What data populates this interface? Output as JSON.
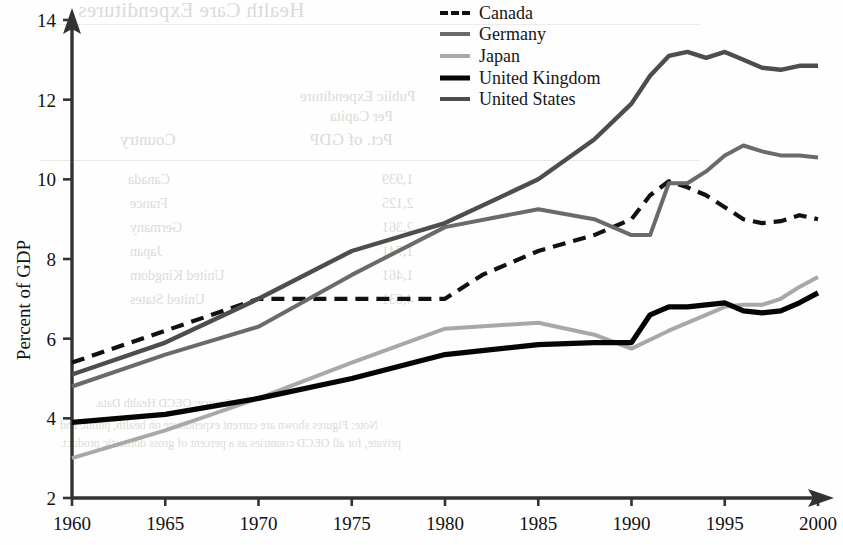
{
  "figure": {
    "y_axis_title": "Percent of GDP",
    "background_bleed": {
      "title": "Health Care Expenditures",
      "head_1": "Public Expenditure",
      "head_2": "Per Capita",
      "head_3": "Country",
      "head_4": "Pct. of GDP",
      "col_left": [
        "Canada",
        "France",
        "Germany",
        "Japan",
        "United Kingdom",
        "United States"
      ],
      "col_right": [
        "1,939",
        "2,125",
        "2,361",
        "1,741",
        "1,461",
        "4,631"
      ],
      "foot_1": "Source: OECD Health Data.",
      "foot_2": "Note: Figures shown are current expenditure on health, public and",
      "foot_3": "private, for all OECD countries as a percent of gross domestic product."
    }
  },
  "chart_data": {
    "type": "line",
    "title": "",
    "xlabel": "",
    "ylabel": "Percent of GDP",
    "xlim": [
      1960,
      2000
    ],
    "ylim": [
      2,
      14
    ],
    "xticks": [
      1960,
      1965,
      1970,
      1975,
      1980,
      1985,
      1990,
      1995,
      2000
    ],
    "yticks": [
      2,
      4,
      6,
      8,
      10,
      12,
      14
    ],
    "grid": false,
    "legend_position": "top-right",
    "series": [
      {
        "name": "Canada",
        "color": "#111111",
        "width": 4.2,
        "dash": "13,8",
        "x": [
          1960,
          1965,
          1970,
          1971,
          1975,
          1980,
          1982,
          1985,
          1988,
          1990,
          1991,
          1992,
          1993,
          1994,
          1995,
          1996,
          1997,
          1998,
          1999,
          2000
        ],
        "values": [
          5.4,
          6.2,
          7.0,
          7.0,
          7.0,
          7.0,
          7.6,
          8.2,
          8.6,
          9.0,
          9.6,
          9.95,
          9.8,
          9.6,
          9.3,
          9.0,
          8.9,
          8.95,
          9.1,
          9.0
        ]
      },
      {
        "name": "Germany",
        "color": "#6a6a6a",
        "width": 4.0,
        "dash": "",
        "x": [
          1960,
          1965,
          1970,
          1975,
          1980,
          1985,
          1988,
          1990,
          1991,
          1992,
          1993,
          1994,
          1995,
          1996,
          1997,
          1998,
          1999,
          2000
        ],
        "values": [
          4.8,
          5.6,
          6.3,
          7.6,
          8.8,
          9.25,
          9.0,
          8.6,
          8.6,
          9.9,
          9.9,
          10.2,
          10.6,
          10.85,
          10.7,
          10.6,
          10.6,
          10.55
        ]
      },
      {
        "name": "Japan",
        "color": "#a8a8a8",
        "width": 4.0,
        "dash": "",
        "x": [
          1960,
          1965,
          1970,
          1975,
          1980,
          1985,
          1988,
          1990,
          1992,
          1994,
          1995,
          1996,
          1997,
          1998,
          1999,
          2000
        ],
        "values": [
          3.0,
          3.7,
          4.5,
          5.4,
          6.25,
          6.4,
          6.1,
          5.75,
          6.2,
          6.6,
          6.8,
          6.85,
          6.85,
          7.0,
          7.3,
          7.55
        ]
      },
      {
        "name": "United Kingdom",
        "color": "#050505",
        "width": 5.2,
        "dash": "",
        "x": [
          1960,
          1965,
          1970,
          1975,
          1980,
          1985,
          1988,
          1990,
          1991,
          1992,
          1993,
          1994,
          1995,
          1996,
          1997,
          1998,
          1999,
          2000
        ],
        "values": [
          3.9,
          4.1,
          4.5,
          5.0,
          5.6,
          5.85,
          5.9,
          5.9,
          6.6,
          6.8,
          6.8,
          6.85,
          6.9,
          6.7,
          6.65,
          6.7,
          6.9,
          7.15
        ]
      },
      {
        "name": "United States",
        "color": "#4d4d4d",
        "width": 4.4,
        "dash": "",
        "x": [
          1960,
          1965,
          1970,
          1975,
          1980,
          1985,
          1988,
          1990,
          1991,
          1992,
          1993,
          1994,
          1995,
          1996,
          1997,
          1998,
          1999,
          2000
        ],
        "values": [
          5.1,
          5.9,
          7.0,
          8.2,
          8.9,
          10.0,
          11.0,
          11.9,
          12.6,
          13.1,
          13.2,
          13.05,
          13.2,
          13.0,
          12.8,
          12.75,
          12.85,
          12.85
        ]
      }
    ]
  }
}
